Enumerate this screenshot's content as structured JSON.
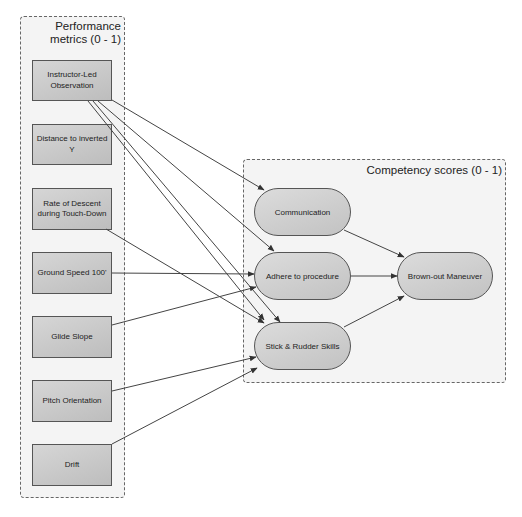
{
  "diagram": {
    "groups": {
      "performance": {
        "title_line1": "Performance",
        "title_line2": "metrics (0 - 1)"
      },
      "competency": {
        "title": "Competency scores (0 - 1)"
      }
    },
    "metrics": [
      {
        "id": "instructor",
        "label": "Instructor-Led Observation"
      },
      {
        "id": "distance",
        "label": "Distance to inverted Y"
      },
      {
        "id": "descent",
        "label": "Rate of Descent during Touch-Down"
      },
      {
        "id": "groundspeed",
        "label": "Ground Speed 100'"
      },
      {
        "id": "glideslope",
        "label": "Glide Slope"
      },
      {
        "id": "pitch",
        "label": "Pitch Orientation"
      },
      {
        "id": "drift",
        "label": "Drift"
      }
    ],
    "competencies": [
      {
        "id": "communication",
        "label": "Communication"
      },
      {
        "id": "adhere",
        "label": "Adhere to procedure"
      },
      {
        "id": "stick",
        "label": "Stick & Rudder Skills"
      },
      {
        "id": "brownout",
        "label": "Brown-out Maneuver"
      }
    ],
    "edges": [
      {
        "from": "Instructor-Led Observation",
        "to": "Communication"
      },
      {
        "from": "Instructor-Led Observation",
        "to": "Adhere to procedure"
      },
      {
        "from": "Instructor-Led Observation",
        "to": "Stick & Rudder Skills"
      },
      {
        "from": "Instructor-Led Observation",
        "to": "Stick & Rudder Skills"
      },
      {
        "from": "Rate of Descent during Touch-Down",
        "to": "Stick & Rudder Skills"
      },
      {
        "from": "Ground Speed 100'",
        "to": "Adhere to procedure"
      },
      {
        "from": "Glide Slope",
        "to": "Adhere to procedure"
      },
      {
        "from": "Pitch Orientation",
        "to": "Stick & Rudder Skills"
      },
      {
        "from": "Drift",
        "to": "Stick & Rudder Skills"
      },
      {
        "from": "Communication",
        "to": "Brown-out Maneuver"
      },
      {
        "from": "Adhere to procedure",
        "to": "Brown-out Maneuver"
      },
      {
        "from": "Stick & Rudder Skills",
        "to": "Brown-out Maneuver"
      }
    ],
    "colors": {
      "node_fill": "#c8c8c8",
      "group_fill": "#f4f4f4",
      "edge": "#444444"
    }
  }
}
